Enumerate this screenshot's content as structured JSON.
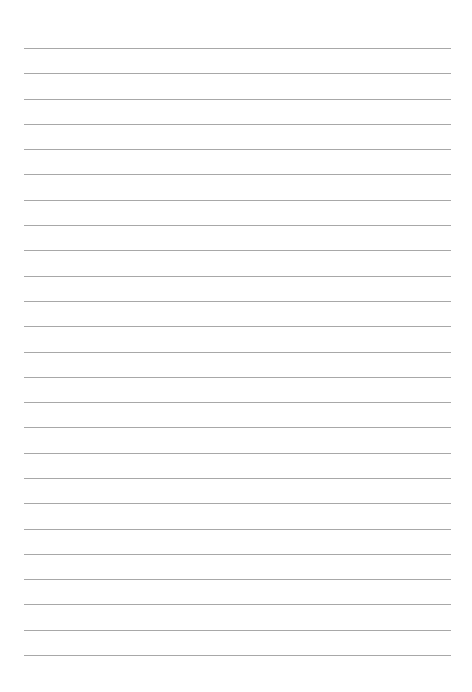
{
  "page": {
    "type": "lined-paper",
    "line_count": 25,
    "line_color": "#a8a8a8",
    "background_color": "#ffffff"
  }
}
